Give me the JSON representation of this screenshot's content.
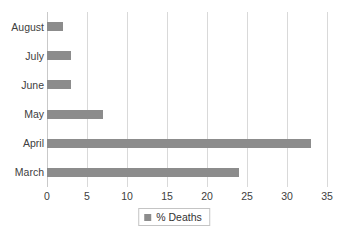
{
  "chart_data": {
    "type": "bar",
    "orientation": "horizontal",
    "title": "",
    "xlabel": "",
    "ylabel": "",
    "categories": [
      "March",
      "April",
      "May",
      "June",
      "July",
      "August"
    ],
    "series": [
      {
        "name": "% Deaths",
        "color": "#8c8c8c",
        "values": [
          24,
          33,
          7,
          3,
          3,
          2
        ]
      }
    ],
    "xlim": [
      0,
      35
    ],
    "xticks": [
      0,
      5,
      10,
      15,
      20,
      25,
      30,
      35
    ],
    "xtick_labels": [
      "0",
      "5",
      "10",
      "15",
      "20",
      "25",
      "30",
      "35"
    ],
    "grid": "vertical",
    "legend": {
      "position": "bottom-center",
      "entries": [
        {
          "label": "% Deaths",
          "swatch": "legend-swatch-icon",
          "color": "#8c8c8c"
        }
      ]
    }
  }
}
